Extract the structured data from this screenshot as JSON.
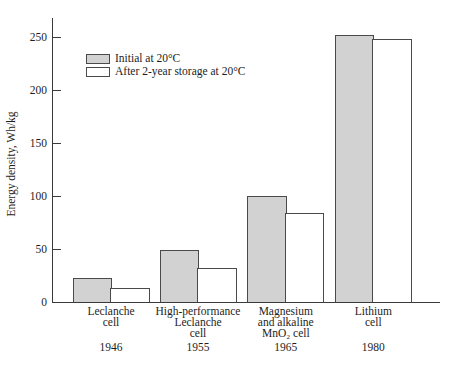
{
  "chart_data": {
    "type": "bar",
    "title": "",
    "xlabel": "",
    "ylabel": "Energy density, Wh/kg",
    "ylim": [
      0,
      265
    ],
    "yticks": [
      0,
      50,
      100,
      150,
      200,
      250
    ],
    "grid": false,
    "legend_position": "upper left inside",
    "categories": [
      "Leclanche cell",
      "High-performance Leclanche cell",
      "Magnesium and alkaline MnO₂ cell",
      "Lithium cell"
    ],
    "category_label_lines": [
      [
        "Leclanche",
        "cell"
      ],
      [
        "High-performance",
        "Leclanche",
        "cell"
      ],
      [
        "Magnesium",
        "and alkaline",
        "MnO₂ cell"
      ],
      [
        "Lithium",
        "cell"
      ]
    ],
    "years": [
      "1946",
      "1955",
      "1965",
      "1980"
    ],
    "series": [
      {
        "name": "Initial at 20°C",
        "values": [
          23,
          49,
          100,
          252
        ],
        "fill": "#d2d2d2"
      },
      {
        "name": "After 2-year storage at 20°C",
        "values": [
          13,
          32,
          84,
          248
        ],
        "fill": "#ffffff"
      }
    ],
    "bar_border_color": "#4a4a4a",
    "axis_color": "#3a3a3a"
  }
}
